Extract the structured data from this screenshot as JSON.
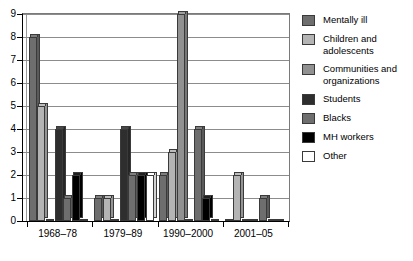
{
  "chart_data": {
    "type": "bar",
    "title": "",
    "subtitle": "",
    "xlabel": "",
    "ylabel": "",
    "ylim": [
      0,
      9
    ],
    "ytick_labels": [
      "0",
      "1",
      "2",
      "3",
      "4",
      "5",
      "6",
      "7",
      "8",
      "9"
    ],
    "ytick_values": [
      0,
      1,
      2,
      3,
      4,
      5,
      6,
      7,
      8,
      9
    ],
    "grid": "horizontal",
    "legend_position": "right",
    "categories": [
      "1968–78",
      "1979–89",
      "1990–2000",
      "2001–05"
    ],
    "series": [
      {
        "name": "Mentally ill",
        "color": "#6e6e6e",
        "values": [
          8,
          1,
          2,
          0
        ]
      },
      {
        "name": "Children and adolescents",
        "color": "#b4b4b4",
        "values": [
          5,
          1,
          3,
          2
        ]
      },
      {
        "name": "Communities and organizations",
        "color": "#919191",
        "values": [
          0,
          0,
          9,
          0
        ]
      },
      {
        "name": "Students",
        "color": "#2e2e2e",
        "values": [
          4,
          4,
          0,
          0
        ]
      },
      {
        "name": "Blacks",
        "color": "#6e6e6e",
        "values": [
          1,
          2,
          4,
          1
        ]
      },
      {
        "name": "MH workers",
        "color": "#000000",
        "values": [
          2,
          2,
          1,
          0
        ]
      },
      {
        "name": "Other",
        "color": "#ffffff",
        "values": [
          0,
          2,
          0,
          0
        ]
      }
    ],
    "bar_groups": [
      {
        "category": "1968–78",
        "bars": [
          {
            "series": "Mentally ill",
            "value": 8,
            "color": "#6e6e6e"
          },
          {
            "series": "Children and adolescents",
            "value": 5,
            "color": "#b4b4b4"
          },
          {
            "series": "Communities and organizations",
            "value": 0,
            "color": "#919191"
          },
          {
            "series": "Students",
            "value": 4,
            "color": "#2e2e2e"
          },
          {
            "series": "Blacks",
            "value": 1,
            "color": "#6e6e6e"
          },
          {
            "series": "MH workers",
            "value": 2,
            "color": "#000000"
          },
          {
            "series": "Other",
            "value": 0,
            "color": "#ffffff"
          }
        ]
      },
      {
        "category": "1979–89",
        "bars": [
          {
            "series": "Mentally ill",
            "value": 1,
            "color": "#6e6e6e"
          },
          {
            "series": "Children and adolescents",
            "value": 1,
            "color": "#b4b4b4"
          },
          {
            "series": "Communities and organizations",
            "value": 0,
            "color": "#919191"
          },
          {
            "series": "Students",
            "value": 4,
            "color": "#2e2e2e"
          },
          {
            "series": "Blacks",
            "value": 2,
            "color": "#6e6e6e"
          },
          {
            "series": "MH workers",
            "value": 2,
            "color": "#000000"
          },
          {
            "series": "Other",
            "value": 2,
            "color": "#ffffff"
          }
        ]
      },
      {
        "category": "1990–2000",
        "bars": [
          {
            "series": "Mentally ill",
            "value": 2,
            "color": "#6e6e6e"
          },
          {
            "series": "Children and adolescents",
            "value": 3,
            "color": "#b4b4b4"
          },
          {
            "series": "Communities and organizations",
            "value": 9,
            "color": "#919191"
          },
          {
            "series": "Students",
            "value": 0,
            "color": "#2e2e2e"
          },
          {
            "series": "Blacks",
            "value": 4,
            "color": "#6e6e6e"
          },
          {
            "series": "MH workers",
            "value": 1,
            "color": "#000000"
          },
          {
            "series": "Other",
            "value": 0,
            "color": "#ffffff"
          }
        ]
      },
      {
        "category": "2001–05",
        "bars": [
          {
            "series": "Mentally ill",
            "value": 0,
            "color": "#6e6e6e"
          },
          {
            "series": "Children and adolescents",
            "value": 2,
            "color": "#b4b4b4"
          },
          {
            "series": "Communities and organizations",
            "value": 0,
            "color": "#919191"
          },
          {
            "series": "Students",
            "value": 0,
            "color": "#2e2e2e"
          },
          {
            "series": "Blacks",
            "value": 1,
            "color": "#6e6e6e"
          },
          {
            "series": "MH workers",
            "value": 0,
            "color": "#000000"
          },
          {
            "series": "Other",
            "value": 0,
            "color": "#ffffff"
          }
        ]
      }
    ]
  },
  "legend": {
    "items": [
      {
        "label": "Mentally ill",
        "color": "#6e6e6e"
      },
      {
        "label": "Children and adolescents",
        "color": "#b4b4b4"
      },
      {
        "label": "Communities and organizations",
        "color": "#919191"
      },
      {
        "label": "Students",
        "color": "#2e2e2e"
      },
      {
        "label": "Blacks",
        "color": "#6e6e6e"
      },
      {
        "label": "MH workers",
        "color": "#000000"
      },
      {
        "label": "Other",
        "color": "#ffffff"
      }
    ]
  },
  "colors": {
    "axis": "#000000",
    "gridline": "#8c8c8c",
    "background": "#ffffff",
    "bar_outline": "#3a3a3a"
  }
}
